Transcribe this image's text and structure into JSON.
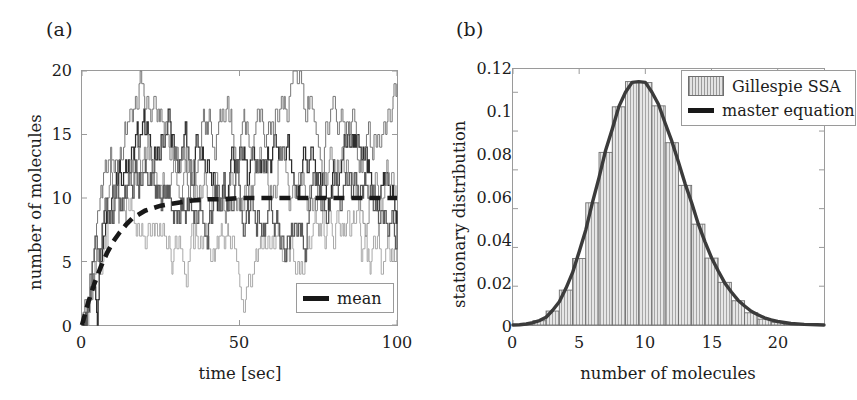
{
  "figure": {
    "panel_a_label": "(a)",
    "panel_b_label": "(b)"
  },
  "panel_a": {
    "xlabel": "time [sec]",
    "ylabel": "number of molecules",
    "xticks": [
      "0",
      "50",
      "100"
    ],
    "yticks": [
      "0",
      "5",
      "10",
      "15",
      "20"
    ],
    "legend": {
      "mean_label": "mean"
    }
  },
  "panel_b": {
    "xlabel": "number of molecules",
    "ylabel": "stationary distribution",
    "xticks": [
      "0",
      "5",
      "10",
      "15",
      "20"
    ],
    "yticks": [
      "0",
      "0.02",
      "0.04",
      "0.06",
      "0.08",
      "0.1",
      "0.12"
    ],
    "legend": {
      "hist_label": "Gillespie SSA",
      "curve_label": "master equation"
    }
  },
  "colors": {
    "axis": "#9a9a9a",
    "text": "#1c1c1c",
    "mean_line": "#181818",
    "master_curve": "#3b3b3b",
    "hist_fill": "#e3e3e3",
    "hist_edge": "#6f6f6f",
    "trace_dark": "#2e2e2e",
    "trace_mid": "#777777",
    "trace_light": "#a9a9a9"
  },
  "chart_data": [
    {
      "type": "line",
      "panel": "(a)",
      "title": "",
      "xlabel": "time [sec]",
      "ylabel": "number of molecules",
      "xlim": [
        0,
        100
      ],
      "ylim": [
        0,
        20
      ],
      "xticks": [
        0,
        50,
        100
      ],
      "yticks": [
        0,
        5,
        10,
        15,
        20
      ],
      "grid": false,
      "legend_position": "lower-right",
      "description": "Five stochastic (Gillespie SSA) step trajectories of molecule number vs time, rising from 0 and fluctuating around the mean of 10; thick dashed black line is the ensemble mean.",
      "series": [
        {
          "name": "trajectory 1",
          "style": "step",
          "color": "#2e2e2e",
          "x": [
            0,
            1,
            2,
            3,
            4,
            5,
            6,
            7,
            8,
            9,
            10,
            12,
            14,
            16,
            18,
            20,
            22,
            24,
            26,
            28,
            30,
            32,
            34,
            36,
            38,
            40,
            42,
            44,
            46,
            48,
            50,
            52,
            54,
            56,
            58,
            60,
            62,
            64,
            66,
            68,
            70,
            72,
            74,
            76,
            78,
            80,
            82,
            84,
            86,
            88,
            90,
            92,
            94,
            96,
            98,
            100
          ],
          "y": [
            0,
            1,
            2,
            3,
            4,
            6,
            7,
            8,
            9,
            10,
            11,
            12,
            13,
            14,
            15,
            14,
            13,
            14,
            15,
            14,
            13,
            12,
            13,
            14,
            13,
            12,
            11,
            10,
            11,
            12,
            13,
            12,
            11,
            12,
            13,
            14,
            13,
            12,
            11,
            12,
            13,
            12,
            11,
            10,
            11,
            12,
            13,
            14,
            13,
            12,
            11,
            10,
            11,
            12,
            11,
            10
          ]
        },
        {
          "name": "trajectory 2",
          "style": "step",
          "color": "#777777",
          "x": [
            0,
            1,
            2,
            3,
            4,
            5,
            6,
            7,
            8,
            9,
            10,
            12,
            14,
            16,
            18,
            20,
            22,
            24,
            26,
            28,
            30,
            32,
            34,
            36,
            38,
            40,
            42,
            44,
            46,
            48,
            50,
            52,
            54,
            56,
            58,
            60,
            62,
            64,
            66,
            68,
            70,
            72,
            74,
            76,
            78,
            80,
            82,
            84,
            86,
            88,
            90,
            92,
            94,
            96,
            98,
            100
          ],
          "y": [
            0,
            1,
            3,
            4,
            6,
            7,
            9,
            10,
            11,
            12,
            13,
            14,
            16,
            17,
            19,
            19,
            18,
            16,
            15,
            14,
            13,
            12,
            13,
            14,
            15,
            16,
            15,
            17,
            16,
            15,
            14,
            15,
            16,
            17,
            16,
            17,
            18,
            19,
            20,
            19,
            18,
            17,
            16,
            15,
            16,
            17,
            16,
            15,
            14,
            13,
            14,
            15,
            16,
            17,
            18,
            18
          ]
        },
        {
          "name": "trajectory 3",
          "style": "step",
          "color": "#a9a9a9",
          "x": [
            0,
            1,
            2,
            3,
            4,
            5,
            6,
            7,
            8,
            9,
            10,
            12,
            14,
            16,
            18,
            20,
            22,
            24,
            26,
            28,
            30,
            32,
            34,
            36,
            38,
            40,
            42,
            44,
            46,
            48,
            50,
            52,
            54,
            56,
            58,
            60,
            62,
            64,
            66,
            68,
            70,
            72,
            74,
            76,
            78,
            80,
            82,
            84,
            86,
            88,
            90,
            92,
            94,
            96,
            98,
            100
          ],
          "y": [
            0,
            1,
            2,
            3,
            4,
            5,
            6,
            7,
            8,
            9,
            10,
            9,
            10,
            9,
            8,
            9,
            8,
            7,
            6,
            5,
            4,
            5,
            6,
            7,
            6,
            7,
            6,
            5,
            6,
            5,
            4,
            4,
            5,
            6,
            5,
            4,
            5,
            6,
            7,
            6,
            5,
            6,
            7,
            8,
            7,
            8,
            9,
            8,
            7,
            6,
            5,
            4,
            3,
            4,
            5,
            5
          ]
        },
        {
          "name": "trajectory 4",
          "style": "step",
          "color": "#8a8a8a",
          "x": [
            0,
            1,
            2,
            3,
            4,
            5,
            6,
            7,
            8,
            9,
            10,
            12,
            14,
            16,
            18,
            20,
            22,
            24,
            26,
            28,
            30,
            32,
            34,
            36,
            38,
            40,
            42,
            44,
            46,
            48,
            50,
            52,
            54,
            56,
            58,
            60,
            62,
            64,
            66,
            68,
            70,
            72,
            74,
            76,
            78,
            80,
            82,
            84,
            86,
            88,
            90,
            92,
            94,
            96,
            98,
            100
          ],
          "y": [
            0,
            2,
            3,
            5,
            6,
            8,
            9,
            10,
            11,
            12,
            12,
            11,
            12,
            13,
            12,
            13,
            12,
            11,
            12,
            11,
            10,
            11,
            10,
            11,
            12,
            11,
            10,
            9,
            10,
            11,
            10,
            11,
            12,
            13,
            12,
            11,
            12,
            11,
            10,
            11,
            12,
            11,
            10,
            11,
            12,
            11,
            12,
            11,
            10,
            9,
            10,
            11,
            12,
            11,
            12,
            11
          ]
        },
        {
          "name": "trajectory 5",
          "style": "step",
          "color": "#5a5a5a",
          "x": [
            0,
            1,
            2,
            3,
            4,
            5,
            6,
            7,
            8,
            9,
            10,
            12,
            14,
            16,
            18,
            20,
            22,
            24,
            26,
            28,
            30,
            32,
            34,
            36,
            38,
            40,
            42,
            44,
            46,
            48,
            50,
            52,
            54,
            56,
            58,
            60,
            62,
            64,
            66,
            68,
            70,
            72,
            74,
            76,
            78,
            80,
            82,
            84,
            86,
            88,
            90,
            92,
            94,
            96,
            98,
            100
          ],
          "y": [
            0,
            1,
            2,
            4,
            5,
            6,
            8,
            9,
            9,
            10,
            11,
            10,
            11,
            12,
            13,
            12,
            11,
            10,
            9,
            10,
            9,
            10,
            11,
            10,
            9,
            10,
            9,
            8,
            9,
            10,
            9,
            8,
            9,
            10,
            9,
            10,
            9,
            8,
            9,
            10,
            9,
            10,
            11,
            10,
            9,
            10,
            9,
            8,
            9,
            10,
            11,
            10,
            9,
            8,
            9,
            10
          ]
        },
        {
          "name": "mean",
          "style": "dashed-thick",
          "color": "#181818",
          "x": [
            0,
            2,
            4,
            6,
            8,
            10,
            12,
            14,
            16,
            18,
            20,
            25,
            30,
            35,
            40,
            45,
            50,
            55,
            60,
            65,
            70,
            75,
            80,
            85,
            90,
            95,
            100
          ],
          "y": [
            0,
            1.8,
            3.3,
            4.6,
            5.7,
            6.6,
            7.3,
            7.9,
            8.4,
            8.7,
            9.0,
            9.4,
            9.6,
            9.8,
            9.9,
            9.9,
            10,
            10,
            10,
            10,
            10,
            10,
            10,
            10,
            10,
            10,
            10
          ]
        }
      ]
    },
    {
      "type": "bar",
      "panel": "(b)",
      "title": "",
      "xlabel": "number of molecules",
      "ylabel": "stationary distribution",
      "xlim": [
        0,
        23.5
      ],
      "ylim": [
        0,
        0.132
      ],
      "xticks": [
        0,
        5,
        10,
        15,
        20
      ],
      "yticks": [
        0,
        0.02,
        0.04,
        0.06,
        0.08,
        0.1,
        0.12
      ],
      "grid": false,
      "legend_position": "upper-right",
      "hist_label": "Gillespie SSA",
      "curve_label": "master equation",
      "categories": [
        0,
        1,
        2,
        3,
        4,
        5,
        6,
        7,
        8,
        9,
        10,
        11,
        12,
        13,
        14,
        15,
        16,
        17,
        18,
        19,
        20,
        21,
        22,
        23
      ],
      "values": [
        0.0,
        0.0004,
        0.0022,
        0.0072,
        0.018,
        0.0343,
        0.063,
        0.089,
        0.1125,
        0.1255,
        0.125,
        0.113,
        0.094,
        0.072,
        0.052,
        0.0345,
        0.022,
        0.0125,
        0.0063,
        0.003,
        0.0014,
        0.0006,
        0.0002,
        0.0001
      ],
      "series": [
        {
          "name": "master equation",
          "type": "line",
          "x": [
            0,
            0.5,
            1,
            1.5,
            2,
            2.5,
            3,
            3.5,
            4,
            4.5,
            5,
            5.5,
            6,
            6.5,
            7,
            7.5,
            8,
            8.5,
            9,
            9.5,
            10,
            10.5,
            11,
            11.5,
            12,
            12.5,
            13,
            13.5,
            14,
            14.5,
            15,
            15.5,
            16,
            16.5,
            17,
            17.5,
            18,
            18.5,
            19,
            19.5,
            20,
            21,
            22,
            23,
            23.5
          ],
          "y": [
            0.0,
            0.0001,
            0.0005,
            0.0012,
            0.0023,
            0.004,
            0.0076,
            0.012,
            0.0189,
            0.027,
            0.0378,
            0.049,
            0.0631,
            0.076,
            0.0901,
            0.101,
            0.1126,
            0.12,
            0.1251,
            0.1255,
            0.1251,
            0.12,
            0.1137,
            0.104,
            0.0948,
            0.084,
            0.0729,
            0.063,
            0.0521,
            0.043,
            0.0347,
            0.028,
            0.0217,
            0.017,
            0.0128,
            0.0098,
            0.0071,
            0.0053,
            0.0037,
            0.0026,
            0.0018,
            0.0008,
            0.0003,
            0.0001,
            0.0
          ]
        }
      ]
    }
  ]
}
